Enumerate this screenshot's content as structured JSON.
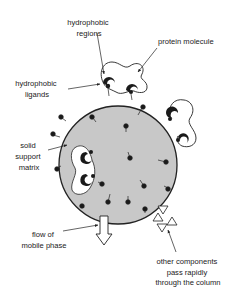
{
  "diagram": {
    "labels": {
      "hydrophobic_regions": [
        "hydrophobic",
        "regions"
      ],
      "protein_molecule": "protein molecule",
      "hydrophobic_ligands": [
        "hydrophobic",
        "ligands"
      ],
      "solid_support_matrix": [
        "solid",
        "support",
        "matrix"
      ],
      "flow_of_mobile_phase": [
        "flow of",
        "mobile phase"
      ],
      "other_components": [
        "other components",
        "pass rapidly",
        "through the column"
      ]
    },
    "colors": {
      "bead_fill": "#c8c8c8",
      "outline": "#222222",
      "ligand": "#1a1a1a",
      "background": "#ffffff"
    }
  }
}
